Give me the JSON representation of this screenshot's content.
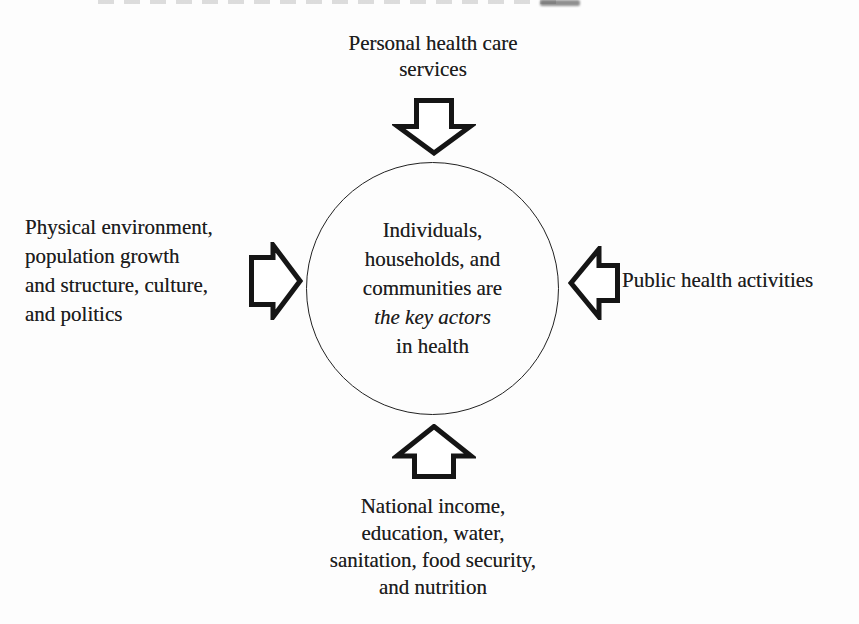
{
  "figure": {
    "top_label": "Personal health care\nservices",
    "left_label": "Physical environment,\npopulation growth\nand structure, culture,\nand politics",
    "right_label": "Public health activities",
    "bottom_label": "National income,\neducation, water,\nsanitation, food security,\nand nutrition",
    "center": {
      "lines": [
        "Individuals,",
        "households, and",
        "communities are",
        "the key actors",
        "in health"
      ],
      "italic_line_index": 3
    },
    "icons": {
      "top": "block-arrow-down-icon",
      "left": "block-arrow-right-icon",
      "right": "block-arrow-left-icon",
      "bottom": "block-arrow-up-icon"
    },
    "colors": {
      "ink": "#1d1d1d",
      "background": "#fdfdfd",
      "arrow_fill": "#ffffff"
    }
  }
}
